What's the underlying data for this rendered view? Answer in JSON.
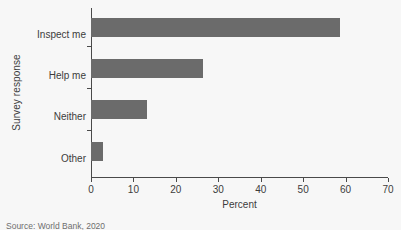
{
  "chart_data": {
    "type": "bar",
    "orientation": "horizontal",
    "title": "",
    "xlabel": "Percent",
    "ylabel": "Survey response",
    "categories": [
      "Inspect me",
      "Help me",
      "Neither",
      "Other"
    ],
    "values": [
      58.7,
      26.4,
      13.2,
      2.8
    ],
    "series": [
      {
        "name": "Percent",
        "values": [
          58.7,
          26.4,
          13.2,
          2.8
        ]
      }
    ],
    "xlim": [
      0,
      70
    ],
    "xticks": [
      0,
      10,
      20,
      30,
      40,
      50,
      60,
      70
    ],
    "xtick_labels": [
      "0",
      "10",
      "20",
      "30",
      "40",
      "50",
      "60",
      "70"
    ],
    "grid": false,
    "legend": false,
    "bar_color": "#6b6b6b",
    "background_color": "#f7f7f7",
    "axis_color": "#4a4a4a"
  },
  "source_note": "Source: World Bank, 2020"
}
